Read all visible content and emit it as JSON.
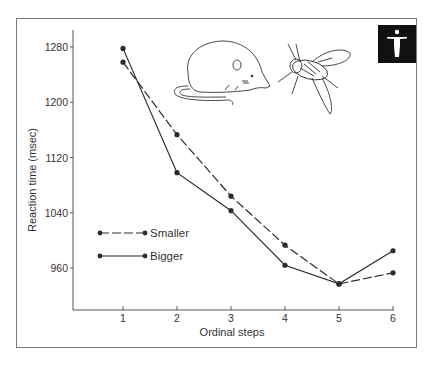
{
  "chart_data": {
    "type": "line",
    "title": "",
    "xlabel": "Ordinal steps",
    "ylabel": "Reaction time (msec)",
    "x": [
      1,
      2,
      3,
      4,
      5,
      6
    ],
    "x_tick_labels": [
      "1",
      "2",
      "3",
      "4",
      "5",
      "6"
    ],
    "y_tick_values": [
      960,
      1040,
      1120,
      1200,
      1280
    ],
    "y_tick_labels": [
      "960",
      "1040",
      "1120",
      "1200",
      "1280"
    ],
    "ylim": [
      900,
      1300
    ],
    "grid": false,
    "legend_position": "left-middle",
    "series": [
      {
        "name": "Smaller",
        "style": "dashed",
        "values": [
          1258,
          1153,
          1064,
          993,
          937,
          953
        ]
      },
      {
        "name": "Bigger",
        "style": "solid",
        "values": [
          1278,
          1098,
          1043,
          964,
          937,
          985
        ]
      }
    ],
    "illustrations": [
      "rat",
      "fly"
    ],
    "badge_icon": "human-figure-icon"
  },
  "legend": {
    "smaller": "Smaller",
    "bigger": "Bigger"
  },
  "axes": {
    "xlabel": "Ordinal steps",
    "ylabel": "Reaction time (msec)"
  },
  "colors": {
    "ink": "#2b2b2b",
    "frame": "#7a7a7a",
    "badge_bg": "#111111",
    "badge_fg": "#ffffff"
  }
}
